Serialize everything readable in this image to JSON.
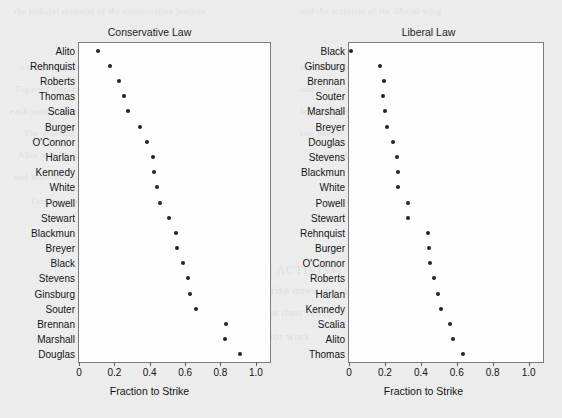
{
  "figure": {
    "background_color": "#ececed",
    "panel_background": "#fdfdfd",
    "marker_color": "#232323",
    "frame_color": "#7b7b7b"
  },
  "ghost_text": [
    {
      "x": 14,
      "y": 6,
      "size": 9,
      "text": "the judicial restraint of the conservative justices"
    },
    {
      "x": 300,
      "y": 6,
      "size": 9,
      "text": "and the activism of the liberal wing"
    },
    {
      "x": 20,
      "y": 62,
      "size": 9,
      "text": "a measure of how often each justice voted"
    },
    {
      "x": 300,
      "y": 62,
      "size": 9,
      "text": "to strike down a law"
    },
    {
      "x": 16,
      "y": 84,
      "size": 9,
      "text": "Figure 2 displays the fraction of conservative"
    },
    {
      "x": 300,
      "y": 84,
      "size": 9,
      "text": "and liberal statutes"
    },
    {
      "x": 10,
      "y": 106,
      "size": 9,
      "text": "each justice voted to strike, ordered from"
    },
    {
      "x": 300,
      "y": 106,
      "size": 9,
      "text": "least to most activist"
    },
    {
      "x": 24,
      "y": 128,
      "size": 9,
      "text": "The ordering is nearly reversed across the"
    },
    {
      "x": 300,
      "y": 128,
      "size": 9,
      "text": "two panels"
    },
    {
      "x": 18,
      "y": 150,
      "size": 9,
      "text": "Alito and Thomas strike liberal laws most often"
    },
    {
      "x": 320,
      "y": 150,
      "size": 9,
      "text": "while Douglas"
    },
    {
      "x": 14,
      "y": 172,
      "size": 9,
      "text": "and Marshall strike conservative laws most often"
    },
    {
      "x": 30,
      "y": 196,
      "size": 9,
      "text": "This pattern is consistent with an ideological"
    },
    {
      "x": 330,
      "y": 196,
      "size": 9,
      "text": "account of review"
    },
    {
      "x": 200,
      "y": 262,
      "size": 13,
      "text": "ASSESSING ACTIVISM"
    },
    {
      "x": 180,
      "y": 284,
      "size": 11,
      "text": "of the justices to strike down the laws of"
    },
    {
      "x": 150,
      "y": 306,
      "size": 11,
      "text": "the statutes that fall within their reach"
    },
    {
      "x": 120,
      "y": 330,
      "size": 11,
      "text": "these have been measured in prior work"
    },
    {
      "x": 400,
      "y": 268,
      "size": 34,
      "text": "A"
    },
    {
      "x": 350,
      "y": 300,
      "size": 26,
      "text": "Justice"
    }
  ],
  "chart_data": [
    {
      "type": "scatter",
      "panel": "left",
      "title": "Conservative Law",
      "xlabel": "Fraction to Strike",
      "ylabel": "",
      "xlim": [
        0.0,
        1.08
      ],
      "xticks": [
        0.0,
        0.2,
        0.4,
        0.6,
        0.8,
        1.0
      ],
      "xticklabels": [
        "0",
        "0.2",
        "0.4",
        "0.6",
        "0.8",
        "1.0"
      ],
      "grid": false,
      "legend": null,
      "categories": [
        "Alito",
        "Rehnquist",
        "Roberts",
        "Thomas",
        "Scalia",
        "Burger",
        "O'Connor",
        "Harlan",
        "Kennedy",
        "White",
        "Powell",
        "Stewart",
        "Blackmun",
        "Breyer",
        "Black",
        "Stevens",
        "Ginsburg",
        "Souter",
        "Brennan",
        "Marshall",
        "Douglas"
      ],
      "values": [
        0.105,
        0.175,
        0.225,
        0.255,
        0.275,
        0.345,
        0.385,
        0.42,
        0.425,
        0.44,
        0.46,
        0.51,
        0.55,
        0.555,
        0.59,
        0.615,
        0.625,
        0.66,
        0.83,
        0.825,
        0.91
      ]
    },
    {
      "type": "scatter",
      "panel": "right",
      "title": "Liberal Law",
      "xlabel": "Fraction to Strike",
      "ylabel": "",
      "xlim": [
        0.0,
        1.08
      ],
      "xticks": [
        0.0,
        0.2,
        0.4,
        0.6,
        0.8,
        1.0
      ],
      "xticklabels": [
        "0",
        "0.2",
        "0.4",
        "0.6",
        "0.8",
        "1.0"
      ],
      "grid": false,
      "legend": null,
      "categories": [
        "Black",
        "Ginsburg",
        "Brennan",
        "Souter",
        "Marshall",
        "Breyer",
        "Douglas",
        "Stevens",
        "Blackmun",
        "White",
        "Powell",
        "Stewart",
        "Rehnquist",
        "Burger",
        "O'Connor",
        "Roberts",
        "Harlan",
        "Kennedy",
        "Scalia",
        "Alito",
        "Thomas"
      ],
      "values": [
        0.01,
        0.175,
        0.195,
        0.19,
        0.2,
        0.21,
        0.245,
        0.265,
        0.275,
        0.272,
        0.33,
        0.33,
        0.44,
        0.445,
        0.45,
        0.475,
        0.495,
        0.51,
        0.56,
        0.58,
        0.635
      ]
    }
  ]
}
